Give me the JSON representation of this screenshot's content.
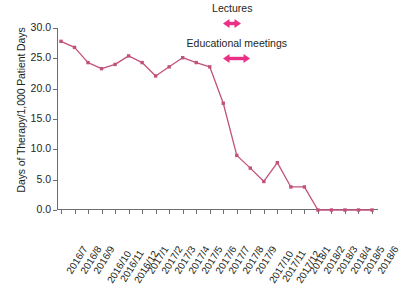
{
  "chart_data": {
    "type": "line",
    "title": "",
    "xlabel": "",
    "ylabel": "Days of Therapy/1,000 Patient Days",
    "ylim": [
      0.0,
      30.0
    ],
    "yticks": [
      "0.0",
      "5.0",
      "10.0",
      "15.0",
      "20.0",
      "25.0",
      "30.0"
    ],
    "ytick_values": [
      0.0,
      5.0,
      10.0,
      15.0,
      20.0,
      25.0,
      30.0
    ],
    "grid": false,
    "legend": "none",
    "categories": [
      "2016/7",
      "2016/8",
      "2016/9",
      "2016/10",
      "2016/11",
      "2016/12",
      "2017/1",
      "2017/2",
      "2017/3",
      "2017/4",
      "2017/5",
      "2017/6",
      "2017/7",
      "2017/8",
      "2017/9",
      "2017/10",
      "2017/11",
      "2017/12",
      "2018/1",
      "2018/2",
      "2018/3",
      "2018/4",
      "2018/5",
      "2018/6"
    ],
    "values": [
      27.8,
      26.8,
      24.3,
      23.3,
      24.0,
      25.4,
      24.3,
      22.1,
      23.6,
      25.1,
      24.3,
      23.6,
      17.6,
      9.0,
      6.9,
      4.7,
      7.8,
      3.8,
      3.8,
      0.0,
      0.0,
      0.0,
      0.0,
      0.0
    ],
    "series": [
      {
        "name": "Days of Therapy/1,000 Patient Days",
        "color": "#c2527c",
        "marker": "square",
        "values": [
          27.8,
          26.8,
          24.3,
          23.3,
          24.0,
          25.4,
          24.3,
          22.1,
          23.6,
          25.1,
          24.3,
          23.6,
          17.6,
          9.0,
          6.9,
          4.7,
          7.8,
          3.8,
          3.8,
          0.0,
          0.0,
          0.0,
          0.0,
          0.0
        ]
      }
    ],
    "annotations": [
      {
        "text": "Lectures",
        "arrow": "double-headed",
        "color": "#ea2f86",
        "span_start_category": "2017/7",
        "span_end_category": "2017/8"
      },
      {
        "text": "Educational meetings",
        "arrow": "double-headed",
        "color": "#ea2f86",
        "span_start_category": "2017/7",
        "span_end_category": "2017/9"
      }
    ]
  },
  "annotations": {
    "lectures": {
      "label": "Lectures"
    },
    "educational_meetings": {
      "label": "Educational meetings"
    }
  },
  "axes": {
    "y_title": "Days of Therapy/1,000 Patient Days"
  },
  "colors": {
    "series_line": "#c2527c",
    "annotation_arrow": "#ea2f86",
    "axis": "#6d6e71",
    "text": "#231f20",
    "background": "#ffffff"
  }
}
